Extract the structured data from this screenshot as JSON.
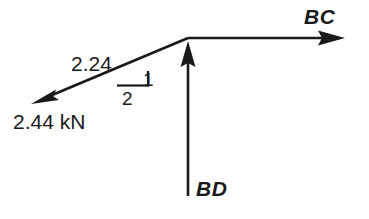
{
  "figure": {
    "kind": "free-body-force-diagram",
    "background_color": "#ffffff",
    "stroke_color": "#1a1a1a"
  },
  "labels": {
    "bc": "BC",
    "bd": "BD",
    "force_component": "2.24",
    "force_magnitude": "2.44 kN",
    "slope_rise": "1",
    "slope_run": "2"
  },
  "vectors": [
    {
      "name": "BC",
      "label": "BC",
      "direction": "right",
      "from": [
        188,
        38
      ],
      "to": [
        345,
        38
      ]
    },
    {
      "name": "BD",
      "label": "BD",
      "direction": "up",
      "from": [
        188,
        196
      ],
      "to": [
        188,
        41
      ]
    },
    {
      "name": "BA",
      "label": "2.44 kN",
      "component_label": "2.24",
      "direction": "down-left",
      "from": [
        188,
        38
      ],
      "to": [
        31,
        104
      ],
      "slope_rise": "1",
      "slope_run": "2"
    }
  ],
  "slope_triangle": {
    "apex": [
      117,
      85
    ],
    "corner": [
      148,
      85
    ],
    "top": [
      148,
      72
    ],
    "rise_label": "1",
    "run_label": "2"
  }
}
